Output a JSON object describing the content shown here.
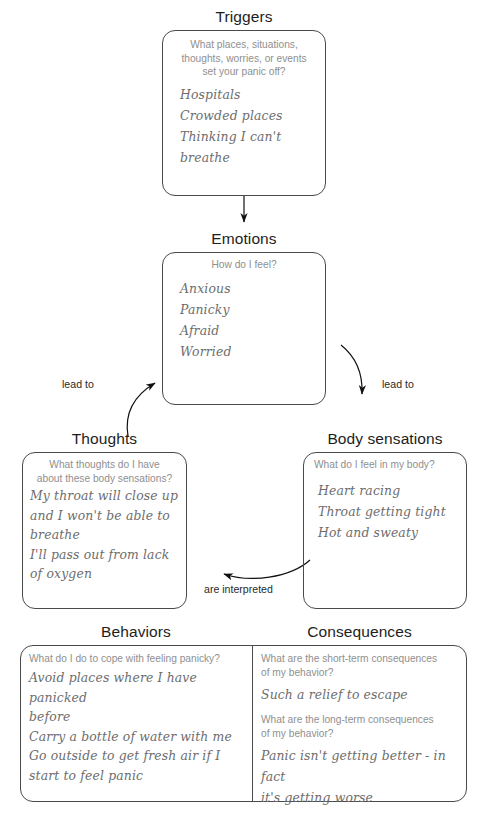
{
  "diagram": {
    "colors": {
      "stroke": "#4a4a4a",
      "prompt_text": "#8f8f8f",
      "answer_text": "#6d6d6d",
      "heading_text": "#1d1d1d",
      "background": "#ffffff"
    }
  },
  "nodes": {
    "triggers": {
      "heading": "Triggers",
      "prompt": "What places, situations,\nthoughts, worries, or events\nset your panic off?",
      "answer": "Hospitals\nCrowded places\nThinking I can't\nbreathe"
    },
    "emotions": {
      "heading": "Emotions",
      "prompt": "How do I feel?",
      "answer": "Anxious\nPanicky\nAfraid\nWorried"
    },
    "thoughts": {
      "heading": "Thoughts",
      "prompt": "What thoughts do I have\nabout these body sensations?",
      "answer": "My throat will close up\nand I won't be able to\nbreathe\nI'll pass out from lack\nof oxygen"
    },
    "body_sensations": {
      "heading": "Body sensations",
      "prompt": "What do I feel in my body?",
      "answer": "Heart racing\nThroat getting tight\nHot and sweaty"
    },
    "behaviors": {
      "heading": "Behaviors",
      "prompt": "What do I do to cope with feeling panicky?",
      "answer": "Avoid places where I have panicked\nbefore\nCarry a bottle of water with me\nGo outside to get fresh air if I\nstart to feel panic"
    },
    "consequences": {
      "heading": "Consequences",
      "prompt_short": "What are the short-term consequences\nof my behavior?",
      "answer_short": "Such a relief to escape",
      "prompt_long": "What are the long-term consequences\nof my behavior?",
      "answer_long": "Panic isn't getting better - in fact\nit's getting worse"
    }
  },
  "connectors": {
    "triggers_to_emotions": {
      "label": "",
      "icon": "down-arrow-icon"
    },
    "emotions_to_thoughts": {
      "label": "lead to",
      "icon": "curved-arrow-icon"
    },
    "emotions_to_body": {
      "label": "lead to",
      "icon": "curved-arrow-icon"
    },
    "body_to_thoughts": {
      "label": "are interpreted",
      "icon": "curved-arrow-icon"
    }
  }
}
